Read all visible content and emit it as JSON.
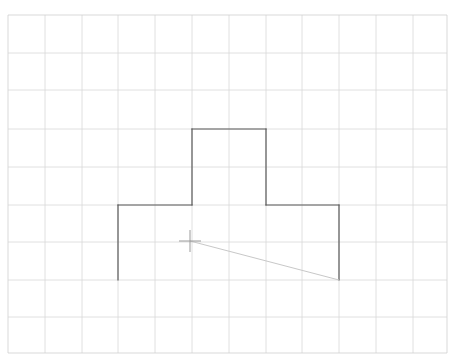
{
  "canvas": {
    "width": 454,
    "height": 361,
    "background_color": "#ffffff",
    "title": "CAD Sketch Canvas"
  },
  "grid": {
    "name": "construction-grid",
    "visible": true,
    "color": "#d8d8d8",
    "border_color": "#cfcfcf",
    "line_width": 0.8,
    "cell_width": 37,
    "cell_height": 37.6,
    "origin_x": 8,
    "origin_y": 15,
    "columns": 12,
    "rows": 9,
    "x_lines": [
      8,
      45,
      82,
      118,
      155,
      192,
      229,
      266,
      302,
      339,
      376,
      413,
      447
    ],
    "y_lines": [
      15,
      53,
      90,
      129,
      167,
      205,
      242,
      280,
      317,
      353
    ]
  },
  "sketch": {
    "name": "t-shaped-profile",
    "stroke_color": "#5a5a5a",
    "stroke_width": 1.2,
    "description": "Open T-shaped polyline profile with missing bottom edge",
    "vertices": [
      {
        "label": "A",
        "x": 118,
        "y": 280
      },
      {
        "label": "B",
        "x": 118,
        "y": 205
      },
      {
        "label": "C",
        "x": 192,
        "y": 205
      },
      {
        "label": "D",
        "x": 192,
        "y": 129
      },
      {
        "label": "E",
        "x": 266,
        "y": 129
      },
      {
        "label": "F",
        "x": 266,
        "y": 205
      },
      {
        "label": "G",
        "x": 339,
        "y": 205
      },
      {
        "label": "H",
        "x": 339,
        "y": 280
      }
    ],
    "closed": false,
    "segments": [
      {
        "name": "left-vertical-edge",
        "x1": 118,
        "y1": 280,
        "x2": 118,
        "y2": 205
      },
      {
        "name": "left-shoulder-edge",
        "x1": 118,
        "y1": 205,
        "x2": 192,
        "y2": 205
      },
      {
        "name": "left-stem-edge",
        "x1": 192,
        "y1": 205,
        "x2": 192,
        "y2": 129
      },
      {
        "name": "top-edge",
        "x1": 192,
        "y1": 129,
        "x2": 266,
        "y2": 129
      },
      {
        "name": "right-stem-edge",
        "x1": 266,
        "y1": 129,
        "x2": 266,
        "y2": 205
      },
      {
        "name": "right-shoulder-edge",
        "x1": 266,
        "y1": 205,
        "x2": 339,
        "y2": 205
      },
      {
        "name": "right-vertical-edge",
        "x1": 339,
        "y1": 205,
        "x2": 339,
        "y2": 280
      }
    ]
  },
  "rubber_band": {
    "name": "rubber-band-line",
    "stroke_color": "#c8c8c8",
    "stroke_width": 1,
    "x1": 190,
    "y1": 241,
    "x2": 339,
    "y2": 280
  },
  "cursor": {
    "name": "crosshair-cursor",
    "color": "#9a9a9a",
    "stroke_width": 1,
    "center_x": 190,
    "center_y": 241,
    "arm_length": 11
  }
}
